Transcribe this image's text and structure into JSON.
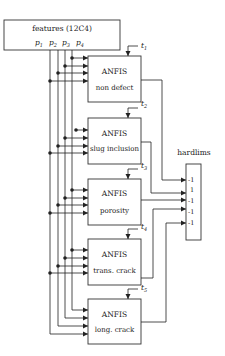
{
  "features": {
    "title": "features (12C4)",
    "inputs": [
      "p",
      "p",
      "p",
      "p"
    ],
    "input_subs": [
      "1",
      "2",
      "3",
      "4"
    ]
  },
  "anfis_blocks": [
    {
      "title": "ANFIS",
      "label": "non defect",
      "target": "t",
      "target_sub": "1"
    },
    {
      "title": "ANFIS",
      "label": "slug inclusion",
      "target": "t",
      "target_sub": "2"
    },
    {
      "title": "ANFIS",
      "label": "porosity",
      "target": "t",
      "target_sub": "3"
    },
    {
      "title": "ANFIS",
      "label": "trans. crack",
      "target": "t",
      "target_sub": "4"
    },
    {
      "title": "ANFIS",
      "label": "long. crack",
      "target": "t",
      "target_sub": "5"
    }
  ],
  "hardlims": {
    "title": "hardlims",
    "outputs": [
      "-1",
      "1",
      "-1",
      "-1",
      "-1"
    ]
  },
  "colors": {
    "line": "#222222",
    "box_stroke": "#333333",
    "background": "#ffffff"
  }
}
